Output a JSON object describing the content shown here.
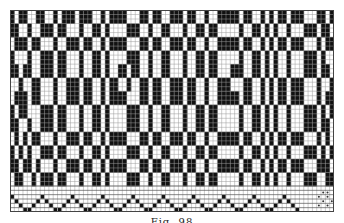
{
  "figure": {
    "type": "weaving point-paper draft",
    "caption": "Fig. 98",
    "grid": {
      "columns": 75,
      "rows": 47,
      "cell_color_on": "#111111",
      "cell_color_off": "#ffffff",
      "line_color": "#444444"
    },
    "pattern_bands": [
      "101100110010111011100101111000110110011101100100111110110010101101110001",
      "110010011101100010011010000111001001100010011011000001001101010010001110",
      "011101100010011101100101111000110110011101100100111110110010101101110001",
      "100010011101100010011010000111001001100010011011000001001101010010001110",
      "110110011101100010011010011011001001100010011011000111001101010010001110",
      "001001100010011101100101100100110110011101100100111000110010101101110001",
      "011101100010011101100101111000110110011101100100111110110010101101110001",
      "101100011101100010011010000111001001100010011011000001001101010010001110",
      "110010011101100010011010000111001001100010011011000001001101010010001110",
      "010101100010011101100101111000110110011101100100111110110010101101110001",
      "101010011101100010011010000111001001100010011011000001001101010010001110",
      "110110100010011101100101111000110110011101100100111110110010101101110001",
      "011001011101100010011010000111001001100010011011000001001101010010001110"
    ],
    "threading_rows": [
      "000000000000000000000000000000000000000000000000000000000000000000000000000",
      "100000010000001000000100000010000001000000100000010000001000000100000000000",
      "010000101000010100001010000101000010100001010000101000010100001010000000000",
      "001001000100100010010001001000100100010010001001000100100010010001000000000",
      "000110000011000001100000110000011000001100000110000011000001100000100000000"
    ]
  }
}
